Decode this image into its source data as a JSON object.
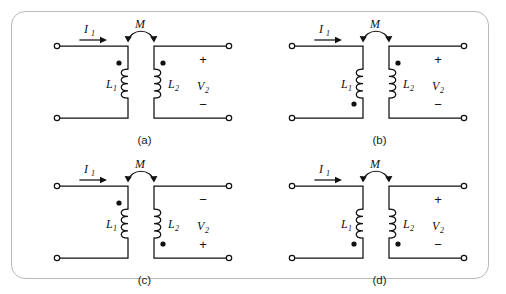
{
  "figure": {
    "border_color": "#b9b9b9",
    "background": "#ffffff",
    "line_color": "#111111"
  },
  "labels": {
    "current": "I",
    "current_sub": "1",
    "mutual": "M",
    "inductor1": "L",
    "inductor1_sub": "1",
    "inductor2": "L",
    "inductor2_sub": "2",
    "voltage": "V",
    "voltage_sub": "2",
    "plus": "+",
    "minus": "−"
  },
  "circuits": [
    {
      "id": "a",
      "caption": "(a)",
      "current_label": "I",
      "current_sub": "1",
      "mutual_label": "M",
      "left_coil_label": "L",
      "left_coil_sub": "1",
      "right_coil_label": "L",
      "right_coil_sub": "2",
      "voltage_label": "V",
      "voltage_sub": "2",
      "left_dot_position": "top",
      "right_dot_position": "top",
      "top_terminal_polarity": "+",
      "bottom_terminal_polarity": "−"
    },
    {
      "id": "b",
      "caption": "(b)",
      "current_label": "I",
      "current_sub": "1",
      "mutual_label": "M",
      "left_coil_label": "L",
      "left_coil_sub": "1",
      "right_coil_label": "L",
      "right_coil_sub": "2",
      "voltage_label": "V",
      "voltage_sub": "2",
      "left_dot_position": "bottom",
      "right_dot_position": "top",
      "top_terminal_polarity": "+",
      "bottom_terminal_polarity": "−"
    },
    {
      "id": "c",
      "caption": "(c)",
      "current_label": "I",
      "current_sub": "1",
      "mutual_label": "M",
      "left_coil_label": "L",
      "left_coil_sub": "1",
      "right_coil_label": "L",
      "right_coil_sub": "2",
      "voltage_label": "V",
      "voltage_sub": "2",
      "left_dot_position": "top",
      "right_dot_position": "bottom",
      "top_terminal_polarity": "−",
      "bottom_terminal_polarity": "+"
    },
    {
      "id": "d",
      "caption": "(d)",
      "current_label": "I",
      "current_sub": "1",
      "mutual_label": "M",
      "left_coil_label": "L",
      "left_coil_sub": "1",
      "right_coil_label": "L",
      "right_coil_sub": "2",
      "voltage_label": "V",
      "voltage_sub": "2",
      "left_dot_position": "bottom",
      "right_dot_position": "bottom",
      "top_terminal_polarity": "+",
      "bottom_terminal_polarity": "−"
    }
  ]
}
